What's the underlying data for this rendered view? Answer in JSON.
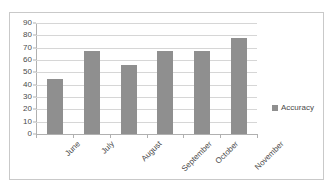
{
  "chart_data": {
    "type": "bar",
    "title": "",
    "xlabel": "",
    "ylabel": "",
    "categories": [
      "June",
      "July",
      "August",
      "September",
      "October",
      "November"
    ],
    "series": [
      {
        "name": "Accuracy",
        "values": [
          45,
          67,
          56,
          67,
          67,
          78
        ],
        "color": "#8f8f8f"
      }
    ],
    "ylim": [
      0,
      90
    ],
    "yticks": [
      0,
      10,
      20,
      30,
      40,
      50,
      60,
      70,
      80,
      90
    ],
    "grid": true,
    "legend": {
      "position": "right",
      "entries": [
        "Accuracy"
      ]
    },
    "colors": {
      "bar": "#8f8f8f",
      "gridline": "#d6d6d6",
      "axis": "#b0b0b0",
      "text": "#4a4a4a",
      "border": "#c9c9c9",
      "background": "#ffffff"
    }
  }
}
